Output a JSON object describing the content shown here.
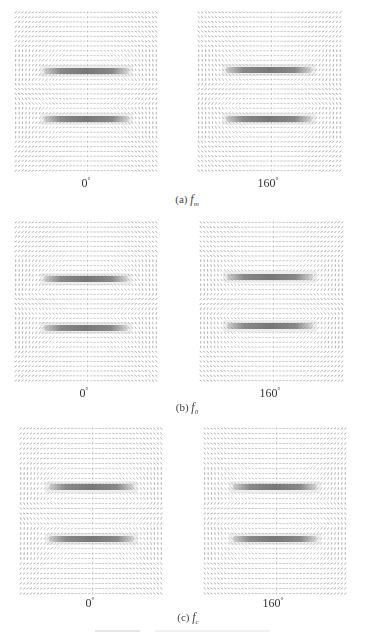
{
  "figure": {
    "type": "vector-field-quiver-grid",
    "rows": [
      {
        "caption_label": "(a)",
        "caption_symbol": "f",
        "caption_subscript": "m",
        "panels": [
          {
            "angle": "0",
            "unit": "°"
          },
          {
            "angle": "160",
            "unit": "°"
          }
        ]
      },
      {
        "caption_label": "(b)",
        "caption_symbol": "f",
        "caption_subscript": "0",
        "panels": [
          {
            "angle": "0",
            "unit": "°"
          },
          {
            "angle": "160",
            "unit": "°"
          }
        ]
      },
      {
        "caption_label": "(c)",
        "caption_symbol": "f",
        "caption_subscript": "c",
        "panels": [
          {
            "angle": "0",
            "unit": "°"
          },
          {
            "angle": "160",
            "unit": "°"
          }
        ]
      }
    ],
    "colors": {
      "arrow": "#6e6e6e",
      "bar": "#5f5f5f",
      "background": "#ffffff"
    }
  }
}
